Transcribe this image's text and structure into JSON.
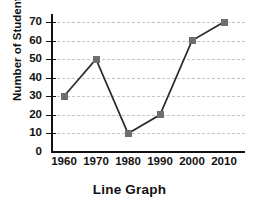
{
  "chart_data": {
    "type": "line",
    "title": "Line Graph",
    "xlabel": "",
    "ylabel": "Number of Students",
    "categories": [
      "1960",
      "1970",
      "1980",
      "1990",
      "2000",
      "2010"
    ],
    "x": [
      1960,
      1970,
      1980,
      1990,
      2000,
      2010
    ],
    "values": [
      30,
      50,
      10,
      20,
      60,
      70
    ],
    "series": [
      {
        "name": "Number of Students",
        "values": [
          30,
          50,
          10,
          20,
          60,
          70
        ]
      }
    ],
    "ylim": [
      0,
      70
    ],
    "yticks": [
      0,
      10,
      20,
      30,
      40,
      50,
      60,
      70
    ],
    "ytick_labels": [
      "0",
      "10",
      "20",
      "30",
      "40",
      "50",
      "60",
      "70"
    ],
    "xtick_labels": [
      "1960",
      "1970",
      "1980",
      "1990",
      "2000",
      "2010"
    ],
    "grid": "horizontal-dashed",
    "legend": "none",
    "marker": "square",
    "colors": {
      "line": "#2b2b2b",
      "marker": "#6e6e6e",
      "grid": "#c6c6c6",
      "axis": "#111111",
      "text": "#111111",
      "background": "#ffffff"
    }
  }
}
